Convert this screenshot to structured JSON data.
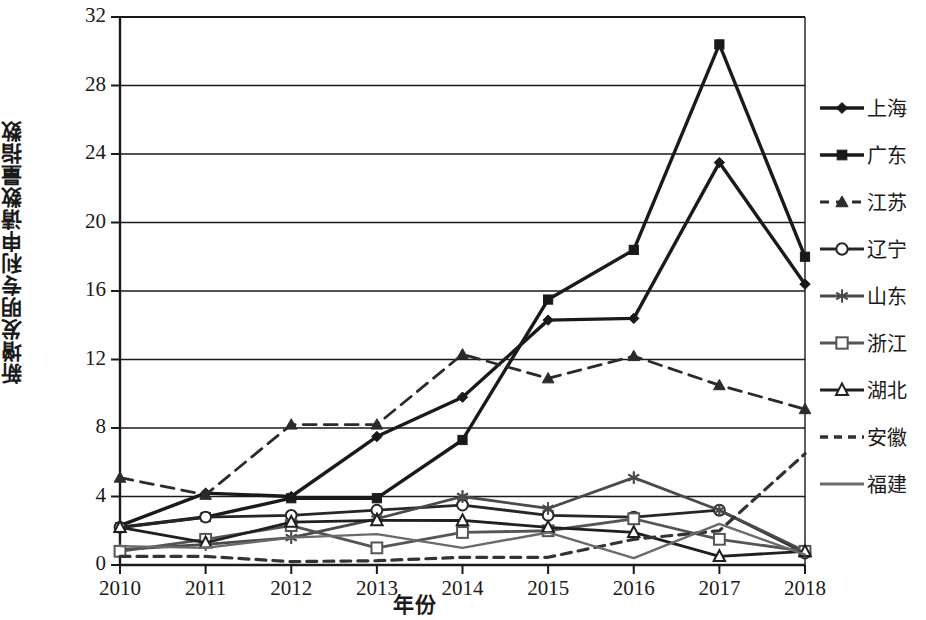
{
  "chart_data": {
    "type": "line",
    "title": "",
    "xlabel": "年份",
    "ylabel": "新增发明专利申请数量指数",
    "x": [
      "2010",
      "2011",
      "2012",
      "2013",
      "2014",
      "2015",
      "2016",
      "2017",
      "2018"
    ],
    "xlim": [
      2010,
      2018
    ],
    "ylim": [
      0,
      32
    ],
    "yticks": [
      0,
      4,
      8,
      12,
      16,
      20,
      24,
      28,
      32
    ],
    "xticks": [
      "2010",
      "2011",
      "2012",
      "2013",
      "2014",
      "2015",
      "2016",
      "2017",
      "2018"
    ],
    "grid": true,
    "grid_axis": "y",
    "legend_position": "right",
    "series": [
      {
        "name": "上海",
        "marker": "filled-diamond",
        "linestyle": "solid",
        "color": "#1a1a1a",
        "values": [
          2.3,
          4.2,
          4.0,
          7.5,
          9.8,
          14.3,
          14.4,
          23.5,
          16.4
        ]
      },
      {
        "name": "广东",
        "marker": "filled-square",
        "linestyle": "solid",
        "color": "#1a1a1a",
        "values": [
          2.2,
          2.8,
          3.9,
          3.9,
          7.3,
          15.5,
          18.4,
          30.4,
          18.0
        ]
      },
      {
        "name": "江苏",
        "marker": "filled-triangle",
        "linestyle": "dashed",
        "color": "#2b2b2b",
        "values": [
          5.1,
          4.1,
          8.2,
          8.2,
          12.3,
          10.9,
          12.2,
          10.5,
          9.1
        ]
      },
      {
        "name": "辽宁",
        "marker": "open-circle",
        "linestyle": "solid",
        "color": "#262626",
        "values": [
          2.2,
          2.8,
          2.9,
          3.2,
          3.5,
          2.9,
          2.8,
          3.2,
          0.7
        ]
      },
      {
        "name": "山东",
        "marker": "asterisk",
        "linestyle": "solid",
        "color": "#4a4a4a",
        "values": [
          0.9,
          1.2,
          1.6,
          2.7,
          4.0,
          3.3,
          5.1,
          3.2,
          0.8
        ]
      },
      {
        "name": "浙江",
        "marker": "open-square",
        "linestyle": "solid",
        "color": "#555555",
        "values": [
          0.8,
          1.5,
          2.3,
          1.0,
          1.9,
          2.0,
          2.7,
          1.5,
          0.8
        ]
      },
      {
        "name": "湖北",
        "marker": "open-triangle",
        "linestyle": "solid",
        "color": "#1f1f1f",
        "values": [
          2.2,
          1.3,
          2.5,
          2.6,
          2.6,
          2.2,
          1.9,
          0.5,
          0.8
        ]
      },
      {
        "name": "安徽",
        "marker": "none",
        "linestyle": "dashed",
        "color": "#333333",
        "values": [
          0.5,
          0.5,
          0.2,
          0.25,
          0.45,
          0.45,
          1.5,
          2.0,
          6.5
        ]
      },
      {
        "name": "福建",
        "marker": "none",
        "linestyle": "solid",
        "color": "#6a6a6a",
        "values": [
          1.1,
          1.0,
          1.6,
          1.8,
          1.0,
          1.9,
          0.4,
          2.4,
          0.6
        ]
      }
    ]
  },
  "legend": {
    "items": [
      {
        "label": "上海"
      },
      {
        "label": "广东"
      },
      {
        "label": "江苏"
      },
      {
        "label": "辽宁"
      },
      {
        "label": "山东"
      },
      {
        "label": "浙江"
      },
      {
        "label": "湖北"
      },
      {
        "label": "安徽"
      },
      {
        "label": "福建"
      }
    ]
  }
}
